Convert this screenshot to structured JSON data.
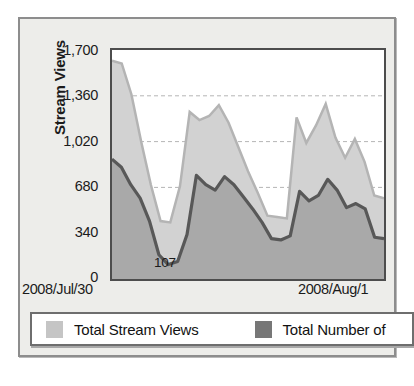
{
  "chart_data": {
    "type": "area",
    "title": "",
    "subtitle": "",
    "xlabel": "",
    "ylabel": "Stream Views",
    "ylim": [
      0,
      1700
    ],
    "yticks": [
      "0",
      "340",
      "680",
      "1,020",
      "1,360",
      "1,700"
    ],
    "ytick_values": [
      0,
      340,
      680,
      1020,
      1360,
      1700
    ],
    "xticks": [
      "2008/Jul/30",
      "2008/Aug/1"
    ],
    "grid": "horizontal-dashed",
    "legend_position": "bottom",
    "series": [
      {
        "name": "Total Stream Views",
        "color": "#d2d2d2",
        "line_color": "#b4b4b4",
        "values": [
          1620,
          1600,
          1370,
          1020,
          700,
          430,
          420,
          690,
          1240,
          1180,
          1210,
          1290,
          1160,
          980,
          800,
          640,
          470,
          460,
          450,
          1200,
          1010,
          1140,
          1300,
          1050,
          900,
          1040,
          870,
          620,
          600
        ]
      },
      {
        "name": "Total Number of",
        "color": "#a9a9a9",
        "line_color": "#585858",
        "values": [
          890,
          830,
          700,
          600,
          430,
          180,
          107,
          130,
          330,
          770,
          700,
          660,
          760,
          700,
          610,
          520,
          420,
          300,
          290,
          320,
          650,
          580,
          620,
          740,
          660,
          530,
          560,
          520,
          310,
          300
        ]
      }
    ],
    "annotations": [
      {
        "text": "107",
        "series": "Total Number of",
        "value": 107
      }
    ]
  },
  "axis": {
    "y_title": "Stream Views",
    "y_ticks": [
      "1,700",
      "1,360",
      "1,020",
      "680",
      "340",
      "0"
    ],
    "x_tick_left": "2008/Jul/30",
    "x_tick_right": "2008/Aug/1"
  },
  "annotation": {
    "min_point": "107"
  },
  "legend": {
    "items": [
      {
        "label": "Total Stream Views",
        "color": "#c5c5c5"
      },
      {
        "label": "Total Number of",
        "color": "#777777"
      }
    ]
  },
  "colors": {
    "panel_bg": "#ededea",
    "plot_bg": "#ffffff",
    "area_light": "#d2d2d2",
    "area_dark": "#a9a9a9",
    "line_dark": "#585858",
    "frame": "#4d4d4d"
  }
}
